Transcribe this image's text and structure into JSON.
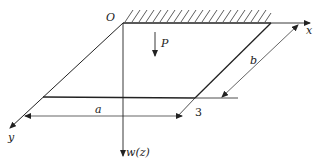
{
  "diagram": {
    "type": "structural mechanics plate schematic",
    "labels": {
      "origin": "O",
      "x_axis": "x",
      "y_axis": "y",
      "w_axis": "w(z)",
      "load": "P",
      "dim_a": "a",
      "dim_b": "b",
      "point": "3"
    },
    "colors": {
      "line": "#222222",
      "background": "#ffffff"
    }
  }
}
